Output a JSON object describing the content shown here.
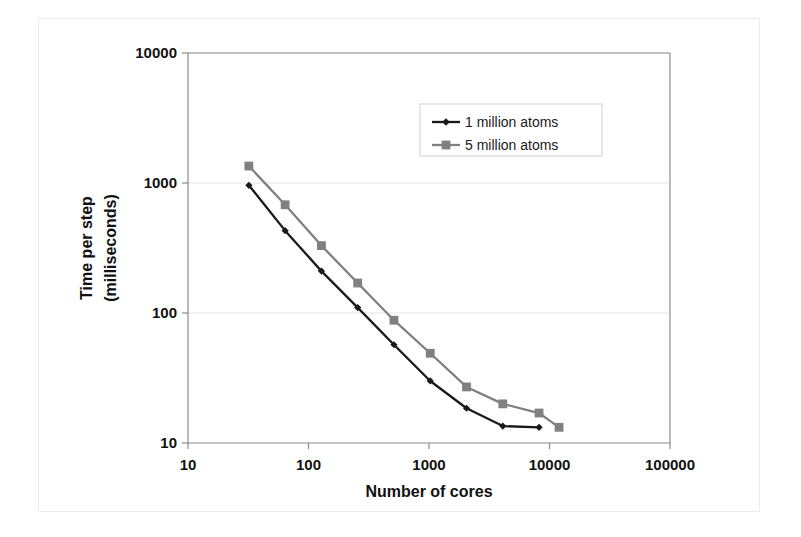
{
  "figure": {
    "background_color": "#ffffff",
    "frame_color": "#ececec",
    "axis_color": "#8c8c8c",
    "gridline_color": "#e4e4e4"
  },
  "chart_data": {
    "type": "line",
    "title": "",
    "xlabel": "Number of cores",
    "ylabel": "Time per step (milliseconds)",
    "xscale": "log",
    "yscale": "log",
    "xlim": [
      10,
      100000
    ],
    "ylim": [
      10,
      10000
    ],
    "xticks": [
      10,
      100,
      1000,
      10000,
      100000
    ],
    "xtick_labels": [
      "10",
      "100",
      "1000",
      "10000",
      "100000"
    ],
    "yticks": [
      10,
      100,
      1000,
      10000
    ],
    "ytick_labels": [
      "10",
      "100",
      "1000",
      "10000"
    ],
    "grid": "horizontal",
    "legend_position": "upper-right-inside",
    "series": [
      {
        "name": "1 million atoms",
        "color": "#1a1a1a",
        "marker": "diamond",
        "x": [
          32,
          64,
          128,
          256,
          512,
          1024,
          2048,
          4096,
          8192
        ],
        "y": [
          960,
          430,
          210,
          110,
          57,
          30,
          18.5,
          13.5,
          13.2
        ]
      },
      {
        "name": "5 million atoms",
        "color": "#808080",
        "marker": "square",
        "x": [
          32,
          64,
          128,
          256,
          512,
          1024,
          2048,
          4096,
          8192,
          12000
        ],
        "y": [
          1350,
          680,
          330,
          170,
          88,
          49,
          27,
          20,
          17,
          13.2
        ]
      }
    ],
    "legend": [
      {
        "label": "1 million atoms",
        "color": "#1a1a1a",
        "marker": "diamond"
      },
      {
        "label": "5 million atoms",
        "color": "#808080",
        "marker": "square"
      }
    ]
  }
}
